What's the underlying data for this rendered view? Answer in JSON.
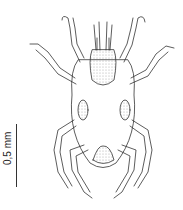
{
  "figure": {
    "scale_bar": {
      "label": "0,5 mm"
    },
    "colors": {
      "ink": "#333333",
      "stipple": "#bbbbbb",
      "background": "#ffffff"
    }
  }
}
